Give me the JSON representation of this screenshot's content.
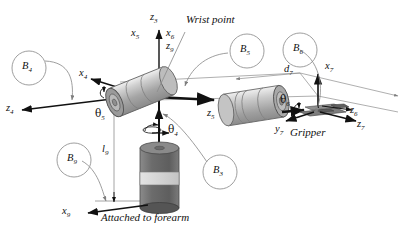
{
  "figure": {
    "title_text": "",
    "background": "#ffffff",
    "ink": "#111111",
    "thin_line": "#8d8d8d"
  },
  "annotations": {
    "wrist_point": "Wrist point",
    "gripper": "Gripper",
    "attached_to_forearm": "Attached to forearm"
  },
  "bodies": [
    {
      "name": "B",
      "sub": "4"
    },
    {
      "name": "B",
      "sub": "5"
    },
    {
      "name": "B",
      "sub": "6"
    },
    {
      "name": "B",
      "sub": "9"
    },
    {
      "name": "B",
      "sub": "3"
    }
  ],
  "axes": [
    {
      "name": "z",
      "sub": "3"
    },
    {
      "name": "x",
      "sub": "5"
    },
    {
      "name": "x",
      "sub": "6"
    },
    {
      "name": "z",
      "sub": "9"
    },
    {
      "name": "x",
      "sub": "4"
    },
    {
      "name": "z",
      "sub": "4"
    },
    {
      "name": "z",
      "sub": "5"
    },
    {
      "name": "x",
      "sub": "7"
    },
    {
      "name": "y",
      "sub": "7"
    },
    {
      "name": "z",
      "sub": "6"
    },
    {
      "name": "z",
      "sub": "7"
    },
    {
      "name": "x",
      "sub": "9"
    }
  ],
  "angles": [
    {
      "symbol": "θ",
      "sub": "5"
    },
    {
      "symbol": "θ",
      "sub": "4"
    },
    {
      "symbol": "θ",
      "sub": "6"
    }
  ],
  "lengths": [
    {
      "name": "l",
      "sub": "9"
    },
    {
      "name": "d",
      "sub": "7"
    }
  ],
  "colors": {
    "cylinder_light": "#c9c9c9",
    "cylinder_mid": "#a8a8a8",
    "cylinder_dark": "#6d6d6d",
    "cylinder_band": "#d9d9d9",
    "gripper_gray": "#7a7a7a"
  }
}
